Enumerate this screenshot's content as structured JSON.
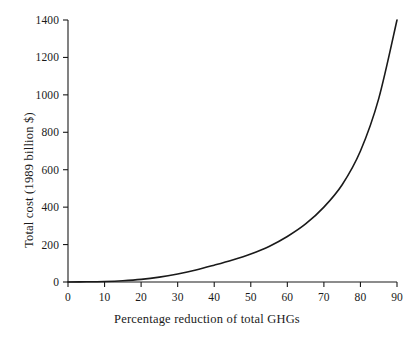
{
  "chart_data": {
    "type": "line",
    "title": "",
    "subtitle": "",
    "xlabel": "Percentage reduction of total GHGs",
    "ylabel": "Total cost (1989 billion $)",
    "xlim": [
      0,
      90
    ],
    "ylim": [
      0,
      1400
    ],
    "xticks": [
      0,
      10,
      20,
      30,
      40,
      50,
      60,
      70,
      80,
      90
    ],
    "xtick_labels": [
      "0",
      "10",
      "20",
      "30",
      "40",
      "50",
      "60",
      "70",
      "80",
      "90"
    ],
    "yticks": [
      0,
      200,
      400,
      600,
      800,
      1000,
      1200,
      1400
    ],
    "ytick_labels": [
      "0",
      "200",
      "400",
      "600",
      "800",
      "1000",
      "1200",
      "1400"
    ],
    "grid": false,
    "legend": false,
    "legend_position": "none",
    "line_color": "#1a1a1a",
    "line_width": 1.6,
    "series": [
      {
        "name": "Total cost of GHG reduction",
        "x": [
          0,
          5,
          10,
          15,
          20,
          25,
          30,
          35,
          40,
          45,
          50,
          55,
          60,
          65,
          70,
          75,
          80,
          85,
          90
        ],
        "values": [
          0,
          1,
          3,
          7,
          14,
          26,
          43,
          64,
          90,
          118,
          150,
          190,
          243,
          310,
          400,
          520,
          700,
          980,
          1400
        ]
      }
    ],
    "annotations": []
  },
  "axes": {
    "y_tick_labels": [
      "1400",
      "1200",
      "1000",
      "800",
      "600",
      "400",
      "200",
      "0"
    ],
    "x_tick_labels": [
      "0",
      "10",
      "20",
      "30",
      "40",
      "50",
      "60",
      "70",
      "80",
      "90"
    ],
    "x_title": "Percentage reduction of total GHGs",
    "y_title": "Total cost (1989 billion $)"
  },
  "colors": {
    "background": "#ffffff",
    "axis": "#1a1a1a",
    "curve": "#1a1a1a",
    "text": "#1a1a1a"
  }
}
